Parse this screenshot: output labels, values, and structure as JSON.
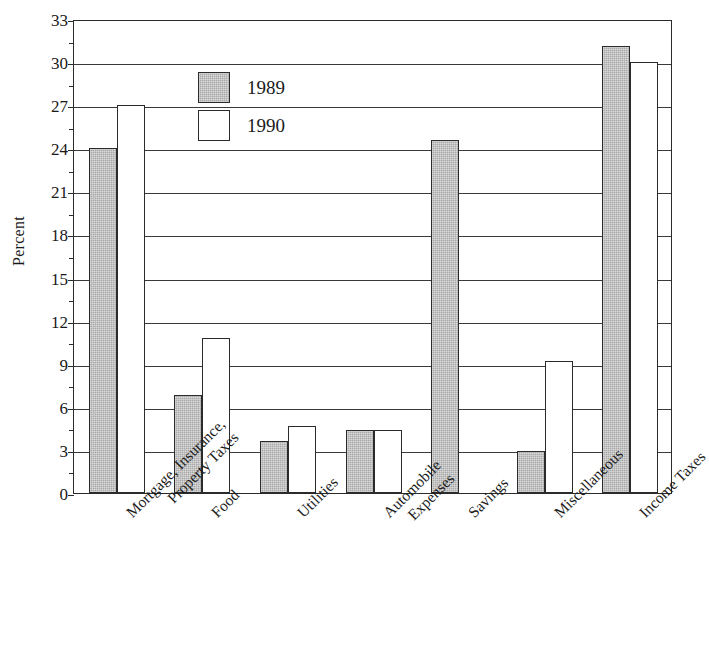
{
  "chart_data": {
    "type": "bar",
    "title": "",
    "xlabel": "",
    "ylabel": "Percent",
    "ylim": [
      0,
      33
    ],
    "ytick_step": 3,
    "yticks": [
      0,
      3,
      6,
      9,
      12,
      15,
      18,
      21,
      24,
      27,
      30,
      33
    ],
    "ytick_labels": [
      "0",
      "3",
      "6",
      "9",
      "12",
      "15",
      "18",
      "21",
      "24",
      "27",
      "30",
      "33"
    ],
    "minor_tick_step": 1.5,
    "grid": true,
    "grid_axis": "y",
    "legend_position": "upper-left-inside",
    "categories": [
      "Mortgage, Insurance, Property Taxes",
      "Food",
      "Utilities",
      "Automobile Expenses",
      "Savings",
      "Miscellaneous",
      "Income Taxes"
    ],
    "category_lines": [
      [
        "Mortgage, Insurance,",
        "Property Taxes"
      ],
      [
        "Food"
      ],
      [
        "Utilities"
      ],
      [
        "Automobile",
        "Expenses"
      ],
      [
        "Savings"
      ],
      [
        "Miscellaneous"
      ],
      [
        "Income Taxes"
      ]
    ],
    "series": [
      {
        "name": "1989",
        "color": "#a9a9a9",
        "values": [
          24.0,
          6.8,
          3.6,
          4.4,
          24.6,
          2.9,
          31.1
        ]
      },
      {
        "name": "1990",
        "color": "#ffffff",
        "values": [
          27.0,
          10.8,
          4.7,
          4.4,
          0,
          9.2,
          30.0
        ]
      }
    ]
  },
  "axis": {
    "y_title": "Percent"
  },
  "legend": {
    "entries": [
      {
        "label": "1989"
      },
      {
        "label": "1990"
      }
    ]
  },
  "colors": {
    "bar_1989": "#a9a9a9",
    "bar_1990": "#ffffff",
    "outline": "#2b2b2b",
    "grid": "#3a3a3a",
    "background": "#ffffff"
  }
}
